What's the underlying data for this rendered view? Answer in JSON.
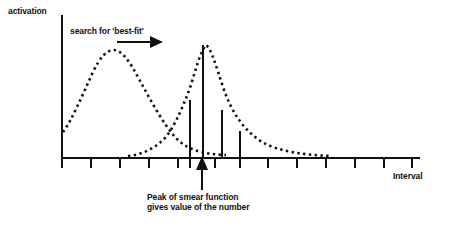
{
  "figure": {
    "background_color": "#ffffff",
    "ink_color": "#111111",
    "width": 454,
    "height": 233,
    "axis_y_label": "activation",
    "axis_x_label": "Interval",
    "annotation_search": "search for 'best-fit'",
    "caption_line_1": "Peak of smear function",
    "caption_line_2": "gives value of the number",
    "icons": {
      "search_arrow": "right-arrow-icon",
      "peak_pointer": "up-arrow-icon"
    }
  },
  "chart_data": {
    "type": "line",
    "title": "",
    "subtitle": "",
    "xlabel": "Interval",
    "ylabel": "activation",
    "grid": false,
    "legend_position": "none",
    "xlim": [
      0,
      100
    ],
    "ylim": [
      0,
      100
    ],
    "axis": {
      "x_axis_pixel_y": 158,
      "y_axis_pixel_x": 62,
      "x_axis_pixel_start": 62,
      "x_axis_pixel_end": 420,
      "y_axis_pixel_top": 15,
      "tick_length_px": 9,
      "tick_pixel_xs": [
        62,
        91,
        120,
        149,
        178,
        202,
        229,
        258,
        287,
        316,
        345,
        374,
        403
      ],
      "tick_labels": []
    },
    "series": [
      {
        "name": "input smear curve (left, dotted)",
        "style": "dotted",
        "marker": "square-dot",
        "points_px": [
          [
            63,
            131
          ],
          [
            66,
            124
          ],
          [
            69,
            117
          ],
          [
            72,
            110
          ],
          [
            75,
            102
          ],
          [
            78,
            95
          ],
          [
            82,
            87
          ],
          [
            86,
            79
          ],
          [
            90,
            71
          ],
          [
            94,
            64
          ],
          [
            99,
            58
          ],
          [
            104,
            53
          ],
          [
            109,
            50
          ],
          [
            114,
            50
          ],
          [
            119,
            52
          ],
          [
            124,
            57
          ],
          [
            129,
            63
          ],
          [
            134,
            70
          ],
          [
            139,
            78
          ],
          [
            144,
            86
          ],
          [
            149,
            94
          ],
          [
            154,
            102
          ],
          [
            159,
            110
          ],
          [
            164,
            118
          ],
          [
            169,
            126
          ],
          [
            174,
            133
          ],
          [
            179,
            139
          ],
          [
            184,
            144
          ],
          [
            189,
            148
          ],
          [
            194,
            151
          ],
          [
            199,
            153
          ],
          [
            205,
            154
          ],
          [
            211,
            155
          ],
          [
            218,
            155
          ],
          [
            226,
            155
          ]
        ]
      },
      {
        "name": "best-fit smear curve (right, dotted)",
        "style": "dotted",
        "marker": "square-dot",
        "points_px": [
          [
            128,
            156
          ],
          [
            134,
            155
          ],
          [
            140,
            154
          ],
          [
            146,
            152
          ],
          [
            152,
            149
          ],
          [
            158,
            145
          ],
          [
            163,
            140
          ],
          [
            168,
            133
          ],
          [
            173,
            125
          ],
          [
            178,
            116
          ],
          [
            183,
            105
          ],
          [
            188,
            93
          ],
          [
            192,
            81
          ],
          [
            196,
            69
          ],
          [
            199,
            58
          ],
          [
            202,
            49
          ],
          [
            205,
            45
          ],
          [
            208,
            46
          ],
          [
            211,
            52
          ],
          [
            214,
            60
          ],
          [
            217,
            69
          ],
          [
            220,
            78
          ],
          [
            223,
            87
          ],
          [
            226,
            95
          ],
          [
            229,
            103
          ],
          [
            233,
            110
          ],
          [
            237,
            117
          ],
          [
            241,
            123
          ],
          [
            245,
            128
          ],
          [
            250,
            133
          ],
          [
            255,
            138
          ],
          [
            260,
            142
          ],
          [
            266,
            145
          ],
          [
            272,
            148
          ],
          [
            278,
            150
          ],
          [
            285,
            152
          ],
          [
            292,
            153
          ],
          [
            299,
            154
          ],
          [
            307,
            155
          ],
          [
            315,
            155
          ],
          [
            323,
            156
          ],
          [
            331,
            156
          ]
        ]
      }
    ],
    "spikes": {
      "name": "activation spikes",
      "items": [
        {
          "x_px": 190,
          "top_px": 100,
          "height_px": 58
        },
        {
          "x_px": 203,
          "top_px": 45,
          "height_px": 113
        },
        {
          "x_px": 222,
          "top_px": 110,
          "height_px": 48
        },
        {
          "x_px": 240,
          "top_px": 131,
          "height_px": 27
        }
      ]
    },
    "annotations": [
      {
        "name": "search-for-best-fit",
        "text": "search for 'best-fit'",
        "arrow": {
          "from_px": [
            117,
            42
          ],
          "to_px": [
            161,
            42
          ],
          "direction": "right"
        }
      },
      {
        "name": "peak-of-smear-function",
        "text": "Peak of smear function gives value of the number",
        "arrow": {
          "from_px": [
            202,
            190
          ],
          "to_px": [
            202,
            157
          ],
          "direction": "up"
        }
      }
    ]
  }
}
